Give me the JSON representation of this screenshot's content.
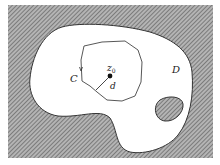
{
  "diagram": {
    "labels": {
      "contour": "C",
      "domain": "D",
      "point_base": "z",
      "point_sub": "0",
      "distance": "d"
    },
    "colors": {
      "hatch_bg": "#9a9a9a",
      "hatch_line": "#5a5a5a",
      "domain_fill": "#ffffff",
      "stroke": "#333333"
    }
  }
}
